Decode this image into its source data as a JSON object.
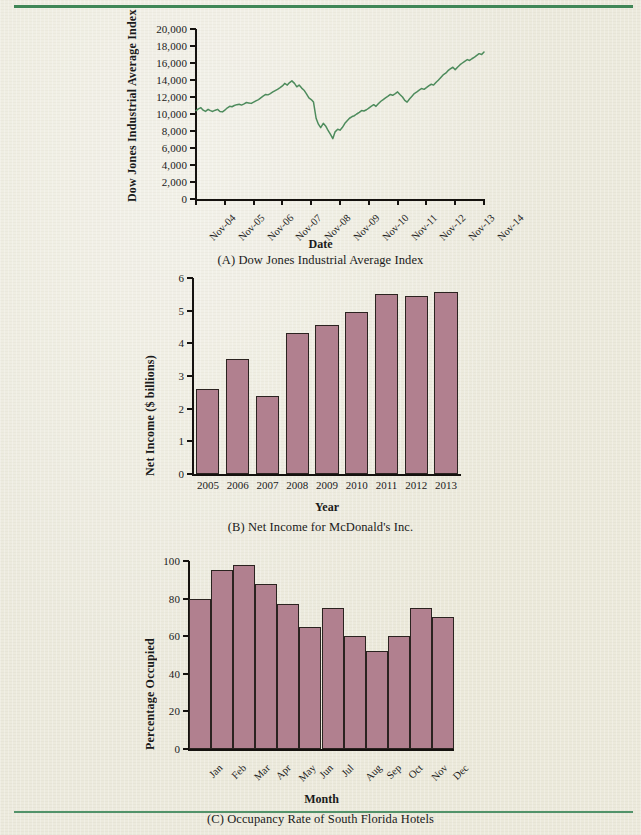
{
  "page": {
    "background_color": "#eceadd",
    "rule_color": "#3f8656",
    "bar_color": "#b1808f",
    "line_color": "#4d8b5c",
    "axis_color": "#15120f"
  },
  "figures": [
    {
      "id": "figure-a",
      "caption": "(A) Dow Jones Industrial Average Index",
      "chart_data": {
        "type": "line",
        "title": "",
        "xlabel": "Date",
        "ylabel": "Dow Jones Industrial Average Index",
        "ylim": [
          0,
          20000
        ],
        "yticks": [
          0,
          2000,
          4000,
          6000,
          8000,
          10000,
          12000,
          14000,
          16000,
          18000,
          20000
        ],
        "ytick_labels": [
          "0",
          "2,000",
          "4,000",
          "6,000",
          "8,000",
          "10,000",
          "12,000",
          "14,000",
          "16,000",
          "18,000",
          "20,000"
        ],
        "xticks": [
          "Nov-04",
          "Nov-05",
          "Nov-06",
          "Nov-07",
          "Nov-08",
          "Nov-09",
          "Nov-10",
          "Nov-11",
          "Nov-12",
          "Nov-13",
          "Nov-14"
        ],
        "grid": false,
        "legend": "none",
        "series": [
          {
            "name": "DJIA",
            "x": [
              0,
              0.08,
              0.17,
              0.25,
              0.33,
              0.42,
              0.5,
              0.58,
              0.67,
              0.75,
              0.83,
              0.92,
              1,
              1.08,
              1.17,
              1.25,
              1.33,
              1.42,
              1.5,
              1.58,
              1.67,
              1.75,
              1.83,
              1.92,
              2,
              2.08,
              2.17,
              2.25,
              2.33,
              2.42,
              2.5,
              2.58,
              2.67,
              2.75,
              2.83,
              2.92,
              3,
              3.08,
              3.17,
              3.25,
              3.33,
              3.42,
              3.5,
              3.58,
              3.67,
              3.75,
              3.83,
              3.92,
              4,
              4.08,
              4.17,
              4.25,
              4.33,
              4.42,
              4.5,
              4.58,
              4.67,
              4.75,
              4.83,
              4.92,
              5,
              5.08,
              5.17,
              5.25,
              5.33,
              5.42,
              5.5,
              5.58,
              5.67,
              5.75,
              5.83,
              5.92,
              6,
              6.08,
              6.17,
              6.25,
              6.33,
              6.42,
              6.5,
              6.58,
              6.67,
              6.75,
              6.83,
              6.92,
              7,
              7.08,
              7.17,
              7.25,
              7.33,
              7.42,
              7.5,
              7.58,
              7.67,
              7.75,
              7.83,
              7.92,
              8,
              8.08,
              8.17,
              8.25,
              8.33,
              8.42,
              8.5,
              8.58,
              8.67,
              8.75,
              8.83,
              8.92,
              9,
              9.08,
              9.17,
              9.25,
              9.33,
              9.42,
              9.5,
              9.58,
              9.67,
              9.75,
              9.83,
              9.92,
              10
            ],
            "values": [
              10400,
              10600,
              10750,
              10450,
              10300,
              10550,
              10400,
              10300,
              10450,
              10550,
              10300,
              10250,
              10450,
              10700,
              10900,
              10850,
              11000,
              11100,
              11150,
              11050,
              11200,
              11350,
              11300,
              11250,
              11400,
              11550,
              11700,
              11900,
              12100,
              12300,
              12250,
              12400,
              12600,
              12750,
              12900,
              13100,
              13300,
              13600,
              13400,
              13700,
              13900,
              13600,
              13200,
              13400,
              13050,
              12800,
              12400,
              11900,
              11700,
              11400,
              9500,
              8800,
              8400,
              8900,
              8600,
              8100,
              7600,
              7100,
              7900,
              8200,
              8100,
              8400,
              8900,
              9200,
              9500,
              9700,
              9800,
              10000,
              10200,
              10400,
              10350,
              10500,
              10700,
              10900,
              11100,
              10900,
              11200,
              11500,
              11700,
              11900,
              12100,
              12300,
              12200,
              12400,
              12600,
              12300,
              12000,
              11600,
              11400,
              11800,
              12100,
              12400,
              12600,
              12800,
              13000,
              12900,
              13100,
              13300,
              13500,
              13400,
              13700,
              14000,
              14300,
              14600,
              14800,
              15100,
              15300,
              15500,
              15200,
              15500,
              15800,
              16000,
              16200,
              16400,
              16300,
              16500,
              16700,
              16900,
              17100,
              17000,
              17300
            ]
          }
        ]
      }
    },
    {
      "id": "figure-b",
      "caption": "(B) Net Income for McDonald's Inc.",
      "chart_data": {
        "type": "bar",
        "title": "",
        "xlabel": "Year",
        "ylabel": "Net Income ($ billions)",
        "ylim": [
          0,
          6
        ],
        "yticks": [
          0,
          1,
          2,
          3,
          4,
          5,
          6
        ],
        "ytick_labels": [
          "0",
          "1",
          "2",
          "3",
          "4",
          "5",
          "6"
        ],
        "categories": [
          "2005",
          "2006",
          "2007",
          "2008",
          "2009",
          "2010",
          "2011",
          "2012",
          "2013"
        ],
        "values": [
          2.6,
          3.53,
          2.4,
          4.33,
          4.55,
          4.95,
          5.5,
          5.46,
          5.58
        ],
        "grid": false,
        "legend": "none"
      }
    },
    {
      "id": "figure-c",
      "caption": "(C) Occupancy Rate of South Florida Hotels",
      "chart_data": {
        "type": "bar",
        "title": "",
        "xlabel": "Month",
        "ylabel": "Percentage Occupied",
        "ylim": [
          0,
          100
        ],
        "yticks": [
          0,
          20,
          40,
          60,
          80,
          100
        ],
        "ytick_labels": [
          "0",
          "20",
          "40",
          "60",
          "80",
          "100"
        ],
        "categories": [
          "Jan",
          "Feb",
          "Mar",
          "Apr",
          "May",
          "Jun",
          "Jul",
          "Aug",
          "Sep",
          "Oct",
          "Nov",
          "Dec"
        ],
        "values": [
          80,
          95,
          98,
          88,
          77,
          65,
          75,
          60,
          52,
          60,
          75,
          70
        ],
        "grid": false,
        "legend": "none",
        "bars_contiguous": true
      }
    }
  ]
}
